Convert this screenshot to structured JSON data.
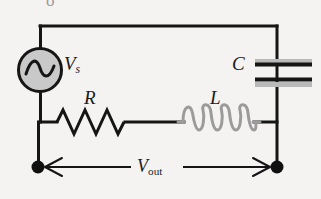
{
  "figure": {
    "background_color": "#f4f3f1",
    "wire_color": "#151515",
    "coil_color": "#9b9b9b",
    "source_fill": "#c9c9c9",
    "node_color": "#101010"
  },
  "labels": {
    "source_main": "V",
    "source_sub": "s",
    "resistor": "R",
    "inductor": "L",
    "capacitor": "C",
    "output_main": "V",
    "output_sub": "out",
    "partial_top_glyph": "o"
  },
  "components": {
    "ac_source": {
      "name": "AC voltage source",
      "symbol": "sine-wave-in-circle",
      "center_x": 40,
      "center_y": 70,
      "radius": 22
    },
    "resistor": {
      "name": "Resistor",
      "symbol": "zigzag",
      "peaks": 6,
      "x_start": 55,
      "x_end": 126,
      "y": 122
    },
    "inductor": {
      "name": "Inductor",
      "symbol": "coil",
      "loops": 4,
      "x_start": 182,
      "x_end": 256,
      "y": 122
    },
    "capacitor": {
      "name": "Capacitor",
      "symbol": "parallel-plates",
      "plate_top_y": 62,
      "plate_bottom_y": 79,
      "x_start": 254,
      "x_end": 312
    }
  },
  "nodes": [
    {
      "name": "left-terminal",
      "x": 38,
      "y": 167
    },
    {
      "name": "right-terminal",
      "x": 277,
      "y": 167
    }
  ],
  "measurement": {
    "name": "V_out span",
    "arrow_left_x": 48,
    "arrow_right_x": 268,
    "y": 167,
    "double_headed": true
  }
}
